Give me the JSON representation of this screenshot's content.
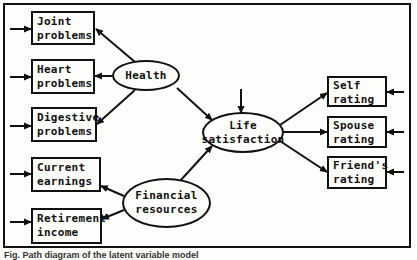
{
  "diagram": {
    "type": "path-diagram",
    "latent_variables": [
      {
        "id": "health",
        "label": "Health",
        "lines": [
          "Health"
        ]
      },
      {
        "id": "financial",
        "label": "Financial resources",
        "lines": [
          "Financial",
          "resources"
        ]
      },
      {
        "id": "life",
        "label": "Life satisfaction",
        "lines": [
          "Life",
          "satisfaction"
        ]
      }
    ],
    "indicators": [
      {
        "id": "joint",
        "lines": [
          "Joint",
          "problems"
        ]
      },
      {
        "id": "heart",
        "lines": [
          "Heart",
          "problems"
        ]
      },
      {
        "id": "digestive",
        "lines": [
          "Digestive",
          "problems"
        ]
      },
      {
        "id": "current",
        "lines": [
          "Current",
          "earnings"
        ]
      },
      {
        "id": "retirement",
        "lines": [
          "Retirement",
          "income"
        ]
      },
      {
        "id": "self",
        "lines": [
          "Self",
          "rating"
        ]
      },
      {
        "id": "spouse",
        "lines": [
          "Spouse",
          "rating"
        ]
      },
      {
        "id": "friend",
        "lines": [
          "Friend's",
          "rating"
        ]
      }
    ],
    "edges": [
      {
        "from": "health",
        "to": "joint"
      },
      {
        "from": "health",
        "to": "heart"
      },
      {
        "from": "health",
        "to": "digestive"
      },
      {
        "from": "financial",
        "to": "current"
      },
      {
        "from": "financial",
        "to": "retirement"
      },
      {
        "from": "health",
        "to": "life"
      },
      {
        "from": "financial",
        "to": "life"
      },
      {
        "from": "life",
        "to": "self"
      },
      {
        "from": "life",
        "to": "spouse"
      },
      {
        "from": "life",
        "to": "friend"
      },
      {
        "from": "error",
        "to": "joint"
      },
      {
        "from": "error",
        "to": "heart"
      },
      {
        "from": "error",
        "to": "digestive"
      },
      {
        "from": "error",
        "to": "current"
      },
      {
        "from": "error",
        "to": "retirement"
      },
      {
        "from": "error",
        "to": "life"
      },
      {
        "from": "error",
        "to": "self"
      },
      {
        "from": "error",
        "to": "spouse"
      },
      {
        "from": "error",
        "to": "friend"
      }
    ],
    "colors": {
      "stroke": "#111111",
      "background": "#fdfdfb"
    }
  },
  "caption": "Fig. Path diagram of the latent variable model"
}
